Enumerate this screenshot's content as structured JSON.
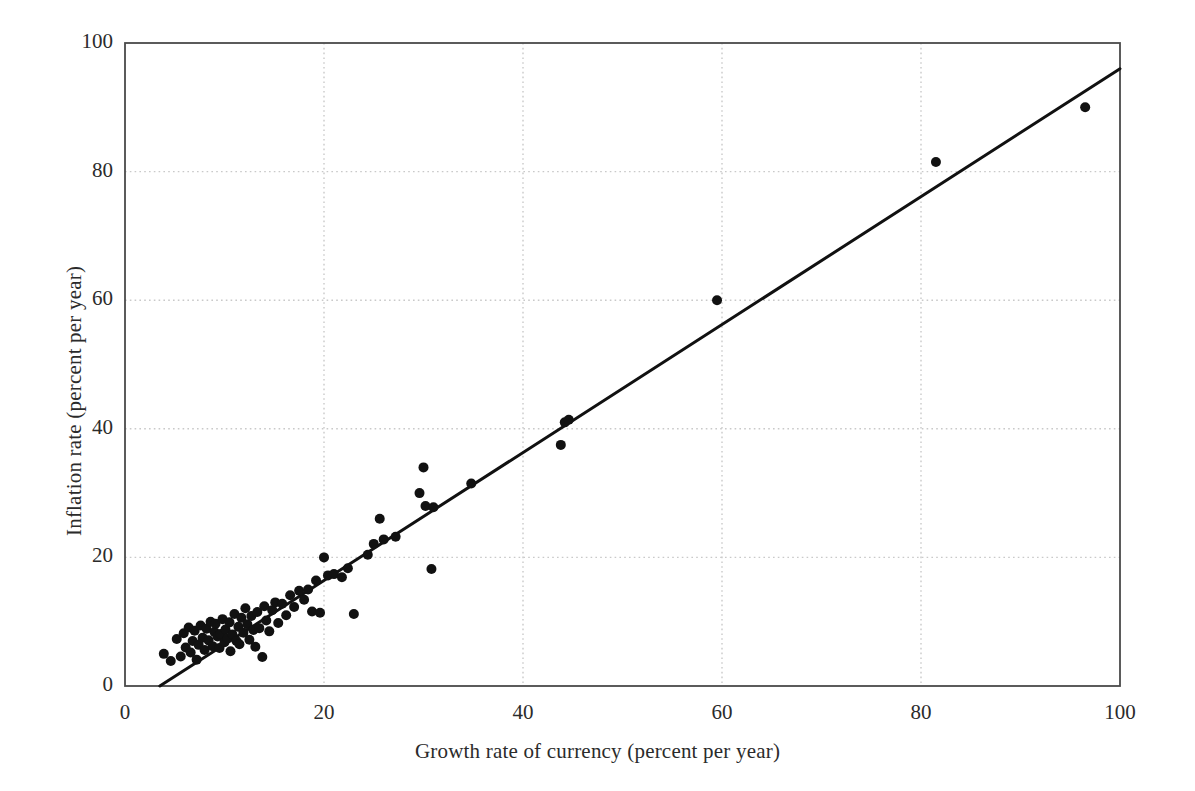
{
  "chart_data": {
    "type": "scatter",
    "title": "",
    "xlabel": "Growth rate of currency (percent per year)",
    "ylabel": "Inflation rate (percent per year)",
    "xlim": [
      0,
      100
    ],
    "ylim": [
      0,
      100
    ],
    "xticks": [
      0,
      20,
      40,
      60,
      80,
      100
    ],
    "yticks": [
      0,
      20,
      40,
      60,
      80,
      100
    ],
    "grid": true,
    "grid_style": "dotted",
    "grid_color": "#c9c9c9",
    "frame_color": "#4a4a4a",
    "legend": null,
    "marker_color": "#111111",
    "marker_radius": 5.0,
    "series": [
      {
        "name": "Countries",
        "points": [
          [
            3.9,
            5.0
          ],
          [
            4.6,
            3.9
          ],
          [
            5.2,
            7.3
          ],
          [
            5.6,
            4.6
          ],
          [
            5.9,
            8.2
          ],
          [
            6.1,
            6.0
          ],
          [
            6.4,
            9.1
          ],
          [
            6.6,
            5.2
          ],
          [
            6.8,
            7.0
          ],
          [
            7.0,
            8.6
          ],
          [
            7.2,
            4.1
          ],
          [
            7.4,
            6.4
          ],
          [
            7.6,
            9.4
          ],
          [
            7.8,
            7.5
          ],
          [
            8.0,
            5.6
          ],
          [
            8.2,
            8.9
          ],
          [
            8.4,
            7.1
          ],
          [
            8.6,
            10.0
          ],
          [
            8.8,
            6.2
          ],
          [
            9.0,
            8.4
          ],
          [
            9.1,
            9.7
          ],
          [
            9.3,
            7.7
          ],
          [
            9.5,
            5.9
          ],
          [
            9.6,
            8.1
          ],
          [
            9.8,
            10.4
          ],
          [
            10.0,
            6.8
          ],
          [
            10.1,
            8.8
          ],
          [
            10.3,
            7.4
          ],
          [
            10.5,
            9.9
          ],
          [
            10.6,
            5.4
          ],
          [
            10.8,
            8.0
          ],
          [
            11.0,
            11.2
          ],
          [
            11.2,
            7.0
          ],
          [
            11.4,
            9.2
          ],
          [
            11.5,
            6.5
          ],
          [
            11.7,
            10.6
          ],
          [
            11.9,
            8.3
          ],
          [
            12.1,
            12.1
          ],
          [
            12.3,
            9.6
          ],
          [
            12.5,
            7.2
          ],
          [
            12.7,
            10.9
          ],
          [
            12.9,
            8.7
          ],
          [
            13.1,
            6.1
          ],
          [
            13.3,
            11.5
          ],
          [
            13.5,
            9.0
          ],
          [
            13.8,
            4.5
          ],
          [
            14.0,
            12.4
          ],
          [
            14.2,
            10.2
          ],
          [
            14.5,
            8.5
          ],
          [
            14.8,
            11.8
          ],
          [
            15.1,
            13.0
          ],
          [
            15.4,
            9.8
          ],
          [
            15.8,
            12.8
          ],
          [
            16.2,
            11.0
          ],
          [
            16.6,
            14.1
          ],
          [
            17.0,
            12.3
          ],
          [
            17.5,
            14.8
          ],
          [
            18.0,
            13.4
          ],
          [
            18.4,
            15.0
          ],
          [
            18.8,
            11.6
          ],
          [
            19.2,
            16.4
          ],
          [
            19.6,
            11.4
          ],
          [
            20.0,
            20.0
          ],
          [
            20.4,
            17.2
          ],
          [
            21.0,
            17.4
          ],
          [
            21.8,
            16.9
          ],
          [
            22.4,
            18.3
          ],
          [
            23.0,
            11.2
          ],
          [
            24.4,
            20.4
          ],
          [
            25.0,
            22.1
          ],
          [
            25.6,
            26.0
          ],
          [
            26.0,
            22.8
          ],
          [
            27.2,
            23.2
          ],
          [
            29.6,
            30.0
          ],
          [
            30.0,
            34.0
          ],
          [
            30.2,
            28.0
          ],
          [
            30.8,
            18.2
          ],
          [
            31.0,
            27.8
          ],
          [
            34.8,
            31.5
          ],
          [
            43.8,
            37.5
          ],
          [
            44.2,
            41.0
          ],
          [
            44.6,
            41.4
          ],
          [
            59.5,
            60.0
          ],
          [
            81.5,
            81.5
          ],
          [
            96.5,
            90.0
          ]
        ]
      }
    ],
    "trendline": {
      "name": "fitted line",
      "x_start": 3.5,
      "y_start": 0.0,
      "x_end": 100.0,
      "y_end": 96.0,
      "color": "#111111",
      "width": 3.0
    }
  },
  "plot_area": {
    "left_px": 125,
    "top_px": 43,
    "right_px": 1120,
    "bottom_px": 686
  }
}
